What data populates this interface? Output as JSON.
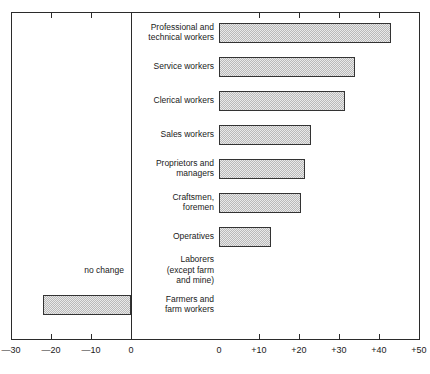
{
  "chart_data": {
    "type": "bar",
    "orientation": "horizontal",
    "title": "",
    "subtitle": "",
    "xlabel": "",
    "ylabel": "",
    "grid": false,
    "legend": null,
    "note": "no change",
    "split_axis": true,
    "left_axis": {
      "ticks": [
        "—30",
        "—20",
        "—10",
        "0"
      ],
      "values": [
        -30,
        -20,
        -10,
        0
      ],
      "xlim": [
        -30,
        0
      ]
    },
    "right_axis": {
      "ticks": [
        "0",
        "+10",
        "+20",
        "+30",
        "+40",
        "+50"
      ],
      "values": [
        0,
        10,
        20,
        30,
        40,
        50
      ],
      "xlim": [
        0,
        50
      ]
    },
    "categories": [
      "Professional and\ntechnical workers",
      "Service workers",
      "Clerical workers",
      "Sales workers",
      "Proprietors and\nmanagers",
      "Craftsmen,\nforemen",
      "Operatives",
      "Laborers\n(except farm\nand mine)",
      "Farmers and\nfarm workers"
    ],
    "values": [
      43,
      34,
      31.5,
      23,
      21.5,
      20.5,
      13,
      0,
      -22
    ]
  },
  "rows": [
    {
      "label_lines": [
        "Professional and",
        "technical workers"
      ],
      "value": 43,
      "side": "right"
    },
    {
      "label_lines": [
        "Service workers"
      ],
      "value": 34,
      "side": "right"
    },
    {
      "label_lines": [
        "Clerical workers"
      ],
      "value": 31.5,
      "side": "right"
    },
    {
      "label_lines": [
        "Sales workers"
      ],
      "value": 23,
      "side": "right"
    },
    {
      "label_lines": [
        "Proprietors and",
        "managers"
      ],
      "value": 21.5,
      "side": "right"
    },
    {
      "label_lines": [
        "Craftsmen,",
        "foremen"
      ],
      "value": 20.5,
      "side": "right"
    },
    {
      "label_lines": [
        "Operatives"
      ],
      "value": 13,
      "side": "right"
    },
    {
      "label_lines": [
        "Laborers",
        "(except farm",
        "and mine)"
      ],
      "value": 0,
      "side": "none"
    },
    {
      "label_lines": [
        "Farmers and",
        "farm workers"
      ],
      "value": -22,
      "side": "left"
    }
  ],
  "annotations": {
    "no_change": "no change"
  },
  "axis": {
    "left_tick_labels": [
      "—30",
      "—20",
      "—10",
      "0"
    ],
    "right_tick_labels": [
      "0",
      "+10",
      "+20",
      "+30",
      "+40",
      "+50"
    ]
  },
  "colors": {
    "bar_fill": "#e9e9e9",
    "bar_hatch": "#b9b9b9",
    "bar_border": "#333333",
    "frame": "#2b2b2b",
    "text": "#1a1a1a",
    "background": "#ffffff"
  }
}
